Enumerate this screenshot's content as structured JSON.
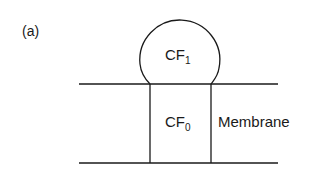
{
  "figure": {
    "panel_label": "(a)",
    "components": {
      "cf1": {
        "base": "CF",
        "subscript": "1"
      },
      "cf0": {
        "base": "CF",
        "subscript": "0"
      },
      "membrane": "Membrane"
    },
    "colors": {
      "stroke": "#1a1a1a",
      "background": "#ffffff"
    }
  }
}
